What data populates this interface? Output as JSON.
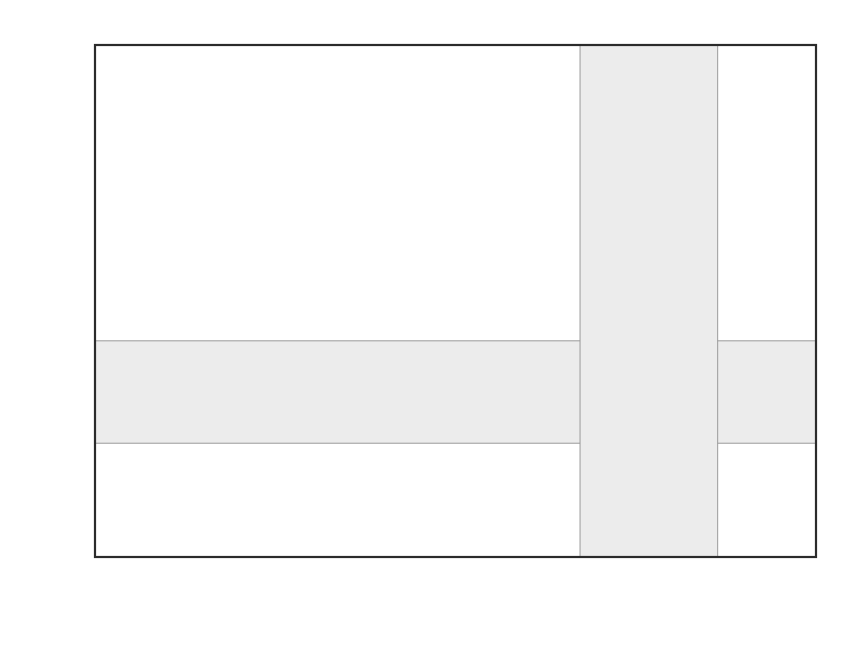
{
  "figure": {
    "background_color": "#ffffff",
    "frame_color": "#2b2b2b",
    "band_color": "#ececec"
  },
  "axes": {
    "x_title_main": "ε",
    "x_title_sub": "Ce",
    "y_title_main": "ε",
    "y_title_sub": "Nd",
    "x_ticklabels": [
      "-1.8",
      "-1.6",
      "-1.4",
      "-1.2",
      "-1",
      "-0.8",
      "-0.6",
      "-0.4",
      "-0.2",
      "0",
      "0.2",
      "0.4"
    ],
    "y_ticklabels": [
      "-4",
      "-2",
      "0",
      "2",
      "4",
      "6",
      "8",
      "10",
      "12",
      "14"
    ]
  },
  "legend": {
    "entries": [
      {
        "label": "MORB",
        "marker": "circle-small-filled",
        "color": "#5c5c5c",
        "col": 0,
        "row": 0
      },
      {
        "label": "Kerguelen-Heard",
        "marker": "triangle-open-gray",
        "color": "#a8a8a8",
        "col": 0,
        "row": 1
      },
      {
        "label": "Tristan-Gough",
        "marker": "triangle-filled",
        "color": "#1f1f1f",
        "col": 0,
        "row": 2
      },
      {
        "label": "St. Helena",
        "marker": "circle-open-gray",
        "color": "#8a8a8a",
        "col": 0,
        "row": 3
      },
      {
        "label": "Austral-Cook",
        "marker": "circle-open-light",
        "color": "#bdbdbd",
        "col": 0,
        "row": 4
      },
      {
        "label": "St. Paul",
        "marker": "diamond-open-gray",
        "color": "#8a8a8a",
        "col": 0,
        "row": 5
      },
      {
        "label": "Tuamotus",
        "marker": "square-half-dark",
        "color": "#2a2a2a",
        "col": 0,
        "row": 6
      },
      {
        "label": "Iceland",
        "marker": "diamond-filled",
        "color": "#555555",
        "col": 1,
        "row": 0
      },
      {
        "label": "Hawaii",
        "marker": "plus",
        "color": "#1f1f1f",
        "col": 1,
        "row": 1
      },
      {
        "label": "Society",
        "marker": "triangle-filled-dk",
        "color": "#333333",
        "col": 1,
        "row": 2
      },
      {
        "label": "Cape Verde",
        "marker": "square-filled-gray",
        "color": "#777777",
        "col": 1,
        "row": 3
      },
      {
        "label": "Azores",
        "marker": "square-open-dark",
        "color": "#1f1f1f",
        "col": 1,
        "row": 4
      },
      {
        "label": "Mascarene",
        "marker": "diamond-open-dark",
        "color": "#1f1f1f",
        "col": 1,
        "row": 5
      }
    ]
  },
  "chart_data": {
    "type": "scatter",
    "title": "",
    "xlabel": "εCe",
    "ylabel": "εNd",
    "xlim": [
      -1.8,
      0.4
    ],
    "ylim": [
      -4,
      14
    ],
    "x_major_step": 0.2,
    "x_minor_step": 0.1,
    "y_major_step": 2,
    "y_minor_step": 1,
    "grid": false,
    "legend_position": "lower-left-inside",
    "shaded_regions": [
      {
        "name": "horizontal-band-enNd",
        "orientation": "horizontal",
        "from": 0.0,
        "to": 3.6
      },
      {
        "name": "vertical-band-enCe",
        "orientation": "vertical",
        "from": -0.32,
        "to": 0.1
      }
    ],
    "series": [
      {
        "name": "MORB",
        "marker": "circle-small-filled",
        "color": "#5c5c5c",
        "points": [
          [
            -1.625,
            10.0
          ],
          [
            -1.625,
            9.7
          ],
          [
            -1.455,
            12.1
          ],
          [
            -1.455,
            11.95
          ],
          [
            -1.455,
            11.2
          ],
          [
            -1.455,
            8.4
          ],
          [
            -1.355,
            10.45
          ],
          [
            -1.355,
            9.95
          ],
          [
            -1.345,
            9.75
          ],
          [
            -1.34,
            9.6
          ],
          [
            -1.34,
            9.45
          ],
          [
            -1.35,
            9.1
          ],
          [
            -1.29,
            11.25
          ],
          [
            -1.275,
            11.35
          ],
          [
            -1.2,
            10.15
          ],
          [
            -1.2,
            9.95
          ],
          [
            -1.2,
            9.7
          ],
          [
            -1.2,
            8.0
          ],
          [
            -1.105,
            10.45
          ],
          [
            -1.115,
            9.95
          ],
          [
            -1.115,
            9.8
          ],
          [
            -1.12,
            9.5
          ],
          [
            -1.03,
            10.2
          ],
          [
            -1.03,
            9.95
          ],
          [
            -1.0,
            9.75
          ],
          [
            -0.98,
            9.55
          ],
          [
            -1.045,
            8.4
          ],
          [
            -1.06,
            7.25
          ],
          [
            -0.94,
            10.8
          ],
          [
            -0.92,
            9.45
          ],
          [
            -0.905,
            8.85
          ],
          [
            -0.905,
            8.1
          ],
          [
            -0.855,
            10.05
          ],
          [
            -0.845,
            10.15
          ],
          [
            -0.83,
            10.1
          ],
          [
            -0.8,
            6.85
          ],
          [
            -0.755,
            9.9
          ],
          [
            -0.74,
            9.75
          ]
        ]
      },
      {
        "name": "Iceland",
        "marker": "diamond-filled",
        "color": "#555555",
        "points": [
          [
            -1.03,
            9.6
          ],
          [
            -1.02,
            9.5
          ],
          [
            -1.01,
            9.45
          ],
          [
            -1.005,
            9.4
          ],
          [
            -1.115,
            9.1
          ],
          [
            -0.93,
            9.1
          ],
          [
            -0.875,
            9.2
          ],
          [
            -0.865,
            8.7
          ],
          [
            -0.905,
            7.7
          ],
          [
            -0.79,
            8.65
          ],
          [
            -0.745,
            7.8
          ],
          [
            -0.36,
            9.2
          ]
        ]
      },
      {
        "name": "Hawaii",
        "marker": "plus",
        "color": "#1f1f1f",
        "points": [
          [
            -0.905,
            6.85
          ],
          [
            -0.8,
            7.25
          ],
          [
            -0.715,
            6.35
          ],
          [
            -0.675,
            6.35
          ],
          [
            -0.645,
            6.45
          ],
          [
            -0.47,
            3.85
          ]
        ]
      },
      {
        "name": "Cape Verde",
        "marker": "square-filled-gray",
        "color": "#777777",
        "points": [
          [
            -0.975,
            6.35
          ],
          [
            -0.855,
            5.35
          ],
          [
            -0.8,
            5.0
          ],
          [
            -0.6,
            5.35
          ],
          [
            -0.56,
            5.6
          ],
          [
            -0.5,
            2.45
          ],
          [
            -0.26,
            3.1
          ],
          [
            -0.25,
            2.05
          ],
          [
            -0.175,
            1.55
          ],
          [
            0.155,
            -1.35
          ]
        ]
      },
      {
        "name": "Tuamotus",
        "marker": "square-half-dark",
        "color": "#2a2a2a",
        "points": [
          [
            -0.905,
            5.75
          ],
          [
            -0.9,
            5.2
          ],
          [
            -0.755,
            5.65
          ],
          [
            -0.58,
            5.8
          ],
          [
            -0.565,
            5.45
          ],
          [
            -0.385,
            3.8
          ]
        ]
      },
      {
        "name": "St. Helena",
        "marker": "circle-open-gray",
        "color": "#8a8a8a",
        "points": [
          [
            -0.815,
            5.35
          ],
          [
            -0.805,
            5.2
          ],
          [
            -0.8,
            5.05
          ],
          [
            -0.775,
            5.45
          ],
          [
            -0.745,
            5.1
          ],
          [
            -0.72,
            4.75
          ],
          [
            -0.705,
            4.6
          ]
        ]
      },
      {
        "name": "Austral-Cook",
        "marker": "circle-open-light",
        "color": "#bdbdbd",
        "points": [
          [
            -0.905,
            5.2
          ],
          [
            -0.68,
            4.65
          ],
          [
            -0.64,
            4.75
          ],
          [
            -0.63,
            4.7
          ],
          [
            -0.24,
            4.2
          ]
        ]
      },
      {
        "name": "St. Paul",
        "marker": "diamond-open-gray",
        "color": "#8a8a8a",
        "points": [
          [
            -0.735,
            4.65
          ],
          [
            -0.71,
            4.45
          ]
        ]
      },
      {
        "name": "Mascarene",
        "marker": "diamond-open-dark",
        "color": "#1f1f1f",
        "points": [
          [
            -0.7,
            4.0
          ],
          [
            -0.655,
            4.05
          ],
          [
            -0.565,
            4.45
          ],
          [
            -0.535,
            4.5
          ],
          [
            -0.595,
            3.95
          ],
          [
            -0.51,
            4.0
          ]
        ]
      },
      {
        "name": "Azores",
        "marker": "square-open-dark",
        "color": "#1f1f1f",
        "points": [
          [
            -0.085,
            1.55
          ]
        ]
      },
      {
        "name": "Kerguelen-Heard",
        "marker": "triangle-open-gray",
        "color": "#a8a8a8",
        "points": [
          [
            -0.06,
            1.35
          ],
          [
            -0.05,
            1.15
          ],
          [
            -0.025,
            1.15
          ],
          [
            0.09,
            -1.1
          ],
          [
            0.155,
            -1.45
          ],
          [
            0.16,
            -2.95
          ],
          [
            0.235,
            -2.1
          ]
        ]
      },
      {
        "name": "Tristan-Gough",
        "marker": "triangle-filled",
        "color": "#1f1f1f",
        "points": [
          [
            -0.365,
            -0.75
          ],
          [
            -0.355,
            -1.4
          ],
          [
            -0.245,
            -1.45
          ],
          [
            -0.24,
            -1.9
          ],
          [
            -0.13,
            -2.15
          ],
          [
            -0.085,
            -1.5
          ],
          [
            -0.06,
            -1.75
          ],
          [
            -0.02,
            -1.85
          ],
          [
            -0.01,
            -1.8
          ]
        ]
      },
      {
        "name": "Society",
        "marker": "triangle-filled-dk",
        "color": "#333333",
        "points": [
          [
            -0.185,
            -0.85
          ],
          [
            -0.155,
            -1.35
          ],
          [
            -0.13,
            -2.45
          ],
          [
            -0.065,
            -1.55
          ],
          [
            -0.045,
            -1.7
          ],
          [
            -0.035,
            -1.75
          ],
          [
            -0.02,
            -1.7
          ],
          [
            0.0,
            -0.2
          ],
          [
            0.005,
            -1.65
          ],
          [
            0.02,
            -1.8
          ],
          [
            0.03,
            -1.75
          ],
          [
            0.04,
            -1.8
          ],
          [
            0.055,
            -1.85
          ],
          [
            0.03,
            -2.3
          ],
          [
            0.075,
            -1.7
          ],
          [
            0.105,
            -1.75
          ],
          [
            0.125,
            -1.8
          ],
          [
            0.145,
            -1.75
          ],
          [
            0.19,
            -1.9
          ],
          [
            0.195,
            -3.15
          ],
          [
            0.335,
            -2.45
          ]
        ]
      }
    ]
  }
}
